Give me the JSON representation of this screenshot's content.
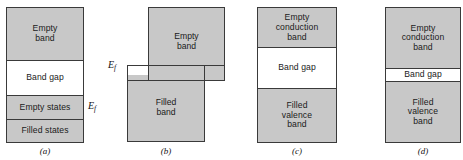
{
  "figure": {
    "fill_color": "#c8c8c8",
    "gap_color": "#ffffff",
    "stroke_color": "#3a3a3a"
  },
  "panels": [
    {
      "caption": "(a)",
      "fermi_label": "E",
      "fermi_sub": "f",
      "bands": [
        {
          "name": "empty-band",
          "label": "Empty\nband",
          "label_line1": "Empty",
          "label_line2": "band",
          "state": "filled"
        },
        {
          "name": "band-gap",
          "label": "Band gap",
          "label_line1": "Band gap",
          "label_line2": "",
          "state": "gap"
        },
        {
          "name": "empty-states",
          "label": "Empty states",
          "label_line1": "Empty states",
          "label_line2": "",
          "state": "filled"
        },
        {
          "name": "filled-states",
          "label": "Filled states",
          "label_line1": "Filled states",
          "label_line2": "",
          "state": "filled"
        }
      ]
    },
    {
      "caption": "(b)",
      "fermi_label": "E",
      "fermi_sub": "f",
      "bands": [
        {
          "name": "empty-band",
          "label_line1": "Empty",
          "label_line2": "band",
          "state": "filled"
        },
        {
          "name": "filled-band",
          "label_line1": "Filled",
          "label_line2": "band",
          "state": "filled"
        }
      ]
    },
    {
      "caption": "(c)",
      "bands": [
        {
          "name": "empty-conduction-band",
          "label_line1": "Empty",
          "label_line2": "conduction",
          "label_line3": "band",
          "state": "filled"
        },
        {
          "name": "band-gap",
          "label_line1": "Band gap",
          "state": "gap"
        },
        {
          "name": "filled-valence-band",
          "label_line1": "Filled",
          "label_line2": "valence",
          "label_line3": "band",
          "state": "filled"
        }
      ]
    },
    {
      "caption": "(d)",
      "bands": [
        {
          "name": "empty-conduction-band",
          "label_line1": "Empty",
          "label_line2": "conduction",
          "label_line3": "band",
          "state": "filled"
        },
        {
          "name": "band-gap",
          "label_line1": "Band gap",
          "state": "gap"
        },
        {
          "name": "filled-valence-band",
          "label_line1": "Filled",
          "label_line2": "valence",
          "label_line3": "band",
          "state": "filled"
        }
      ]
    }
  ]
}
